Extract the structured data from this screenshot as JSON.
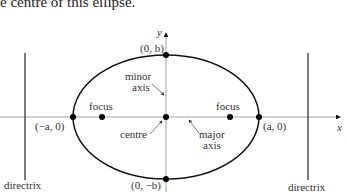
{
  "caption": "e centre of this ellipse.",
  "diagram": {
    "axes": {
      "x_label": "x",
      "y_label": "y"
    },
    "points": {
      "top": "(0, b)",
      "bottom": "(0, −b)",
      "left": "(−a, 0)",
      "right": "(a, 0)"
    },
    "labels": {
      "focus_left": "focus",
      "focus_right": "focus",
      "minor_axis_line1": "minor",
      "minor_axis_line2": "axis",
      "major_axis_line1": "major",
      "major_axis_line2": "axis",
      "centre": "centre",
      "directrix_left": "directrix",
      "directrix_right": "directrix"
    }
  }
}
